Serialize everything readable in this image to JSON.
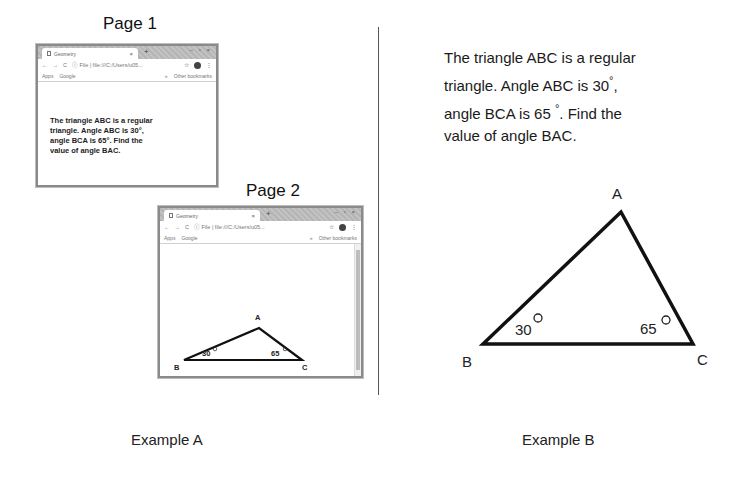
{
  "example_a": {
    "label": "Example A",
    "page1": {
      "label": "Page 1",
      "browser": {
        "tab_title": "Geometry",
        "tab_close": "×",
        "new_tab": "+",
        "window_controls": "– ▫ ×",
        "nav_back": "←",
        "nav_forward": "→",
        "reload": "C",
        "url": "ⓘ File | file:///C:/Users/u05...",
        "star": "☆",
        "menu": "⋮",
        "bookmarks": {
          "apps": "Apps",
          "google": "Google",
          "overflow": "»",
          "other": "Other bookmarks"
        }
      },
      "problem_lines": [
        "The triangle ABC is a regular",
        "triangle. Angle ABC is 30°,",
        "angle BCA is 65°. Find the",
        "value of angle BAC."
      ]
    },
    "page2": {
      "label": "Page 2",
      "browser": {
        "tab_title": "Geometry",
        "tab_close": "×",
        "new_tab": "+",
        "window_controls": "– ▫ ×",
        "nav_back": "←",
        "nav_forward": "→",
        "reload": "C",
        "url": "ⓘ File | file:///C:/Users/u05...",
        "star": "☆",
        "menu": "⋮",
        "bookmarks": {
          "apps": "Apps",
          "google": "Google",
          "overflow": "»",
          "other": "Other bookmarks"
        }
      },
      "triangle": {
        "vertex_a": "A",
        "vertex_b": "B",
        "vertex_c": "C",
        "angle_b": "30",
        "angle_c": "65",
        "degree": "°"
      }
    }
  },
  "example_b": {
    "label": "Example B",
    "problem_lines": [
      "The triangle ABC is a regular",
      "triangle. Angle ABC is 30",
      ",",
      "angle BCA is 65",
      ". Find the",
      "value of angle BAC."
    ],
    "degree_symbol": "°",
    "triangle": {
      "vertex_a": "A",
      "vertex_b": "B",
      "vertex_c": "C",
      "angle_b": "30",
      "angle_c": "65",
      "degree": "°"
    }
  }
}
